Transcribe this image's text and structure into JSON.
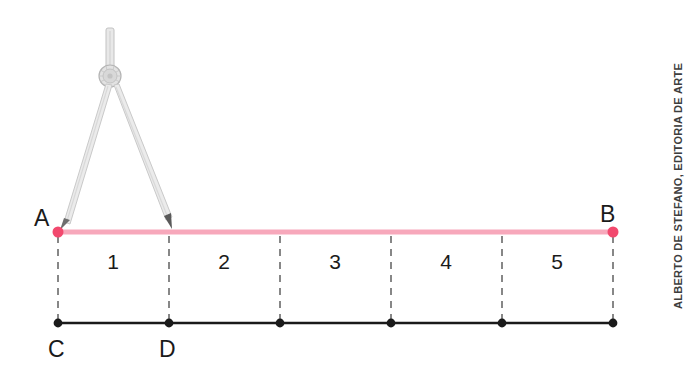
{
  "figure": {
    "background_color": "#ffffff",
    "top_line": {
      "name": "segment-AB",
      "color": "#f7a8bb",
      "endpoint_color": "#f2496e",
      "start_label": "A",
      "end_label": "B",
      "start_x": 58,
      "end_x": 613,
      "y": 232,
      "divisions": 5,
      "tick_x": [
        58,
        169,
        280,
        391,
        502,
        613
      ],
      "segment_labels": [
        "1",
        "2",
        "3",
        "4",
        "5"
      ],
      "segment_label_y": 262
    },
    "bottom_line": {
      "name": "segment-CD",
      "color": "#1a1a1a",
      "start_label": "C",
      "end_label": "D",
      "start_x": 58,
      "end_x": 613,
      "y": 323,
      "point_x": [
        58,
        169,
        280,
        391,
        502,
        613
      ],
      "label_y": 350
    },
    "dashed_connectors": {
      "color": "#555555",
      "dash": "7 6",
      "x_positions": [
        58,
        169,
        280,
        391,
        502,
        613
      ],
      "y_top": 236,
      "y_bottom": 321
    },
    "compass": {
      "name": "drafting-compass",
      "color": "#b8b8b8",
      "hinge_x": 110,
      "hinge_y": 75,
      "handle_top_y": 28,
      "left_tip_x": 60,
      "right_tip_x": 170,
      "tip_y": 228
    },
    "labels": {
      "A": "A",
      "B": "B",
      "C": "C",
      "D": "D",
      "label_color": "#1a1a1a"
    }
  },
  "credit": {
    "text": "ALBERTO DE STEFANO, EDITORIA DE ARTE",
    "color": "#3d3d3d"
  }
}
